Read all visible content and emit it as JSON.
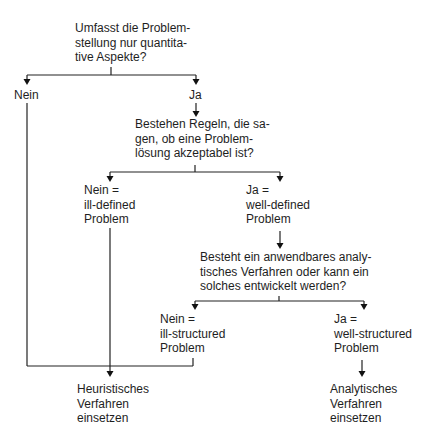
{
  "diagram": {
    "type": "decision-flowchart",
    "nodes": {
      "q1": {
        "text": "Umfasst die Problem-\nstellung nur quantita-\ntive Aspekte?"
      },
      "q1_no": {
        "text": "Nein"
      },
      "q1_yes": {
        "text": "Ja"
      },
      "q2": {
        "text": "Bestehen Regeln, die sa-\ngen, ob eine Problem-\nlösung akzeptabel ist?"
      },
      "q2_no": {
        "text": "Nein =\nill-defined\nProblem"
      },
      "q2_yes": {
        "text": "Ja =\nwell-defined\nProblem"
      },
      "q3": {
        "text": "Besteht ein anwendbares analy-\ntisches Verfahren oder kann ein\nsolches entwickelt werden?"
      },
      "q3_no": {
        "text": "Nein =\nill-structured\nProblem"
      },
      "q3_yes": {
        "text": "Ja =\nwell-structured\nProblem"
      },
      "result_heuristic": {
        "text": "Heuristisches\nVerfahren\neinsetzen"
      },
      "result_analytic": {
        "text": "Analytisches\nVerfahren\neinsetzen"
      }
    },
    "edges": [
      {
        "from": "q1",
        "to": "q1_no"
      },
      {
        "from": "q1",
        "to": "q1_yes"
      },
      {
        "from": "q1_yes",
        "to": "q2"
      },
      {
        "from": "q2",
        "to": "q2_no"
      },
      {
        "from": "q2",
        "to": "q2_yes"
      },
      {
        "from": "q2_yes",
        "to": "q3"
      },
      {
        "from": "q3",
        "to": "q3_no"
      },
      {
        "from": "q3",
        "to": "q3_yes"
      },
      {
        "from": "q1_no",
        "to": "result_heuristic"
      },
      {
        "from": "q2_no",
        "to": "result_heuristic"
      },
      {
        "from": "q3_no",
        "to": "result_heuristic"
      },
      {
        "from": "q3_yes",
        "to": "result_analytic"
      }
    ],
    "colors": {
      "background": "#ffffff",
      "text": "#1e1e1e",
      "lines": "#222222"
    }
  }
}
